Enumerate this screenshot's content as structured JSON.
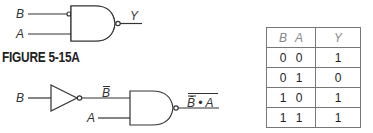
{
  "figure_label": "FIGURE 5-15A",
  "top_circuit": {
    "inputs": [
      "B",
      "A"
    ],
    "output": "Y",
    "gate": "nand-with-inverted-B-input"
  },
  "bottom_circuit": {
    "input_B": "B",
    "inverter_output": "B̄",
    "input_A": "A",
    "output": "B̄ • A"
  },
  "truth_table": {
    "headers": {
      "b": "B",
      "a": "A",
      "y": "Y"
    },
    "rows": [
      {
        "b": "0",
        "a": "0",
        "y": "1"
      },
      {
        "b": "0",
        "a": "1",
        "y": "0"
      },
      {
        "b": "1",
        "a": "0",
        "y": "1"
      },
      {
        "b": "1",
        "a": "1",
        "y": "1"
      }
    ]
  }
}
